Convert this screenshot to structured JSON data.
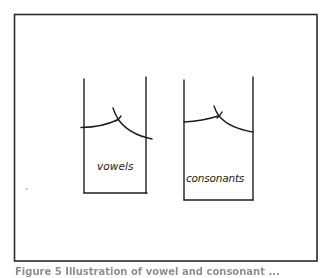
{
  "figure": {
    "frame": {
      "x": 14,
      "y": 14,
      "width": 303,
      "height": 247,
      "stroke": "#2b2b2b"
    },
    "containers": [
      {
        "id": "vowels",
        "label": "vowels",
        "left_wall_x": 84,
        "right_wall_x": 146,
        "top_y": 79,
        "bottom_y": 193
      },
      {
        "id": "consonants",
        "label": "consonants",
        "left_wall_x": 184,
        "right_wall_x": 253,
        "top_y": 80,
        "bottom_y": 200
      }
    ],
    "caption": "Figure 5 Illustration of vowel and consonant ...",
    "colors": {
      "line": "#1e1e1e",
      "background": "#ffffff"
    }
  }
}
